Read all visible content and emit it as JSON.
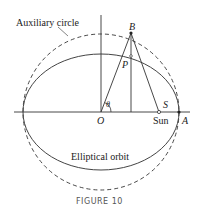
{
  "labels": {
    "auxiliary_circle": "Auxiliary circle",
    "elliptical_orbit": "Elliptical orbit",
    "B": "B",
    "P": "P",
    "O": "O",
    "S": "S",
    "sun": "Sun",
    "A": "A",
    "theta": "θ"
  },
  "caption": "FIGURE 10",
  "geometry": {
    "center": [
      101,
      112
    ],
    "circle_radius": 78,
    "ellipse_semi_major": 78,
    "ellipse_semi_minor": 58,
    "point_B": [
      131,
      33
    ],
    "point_P": [
      131,
      56
    ],
    "sun_focus": [
      159,
      112
    ],
    "point_A": [
      179,
      112
    ]
  }
}
